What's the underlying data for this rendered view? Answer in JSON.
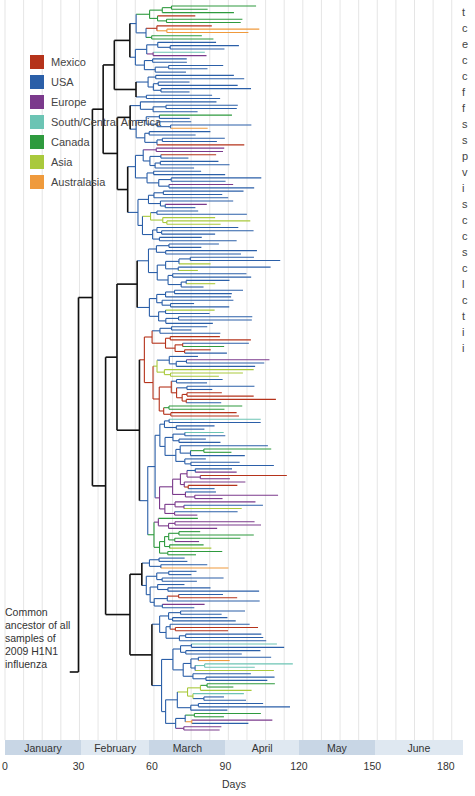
{
  "legend": [
    {
      "label": "Mexico",
      "key": "mexico",
      "color": "#b5331b"
    },
    {
      "label": "USA",
      "key": "usa",
      "color": "#2b5fa8"
    },
    {
      "label": "Europe",
      "key": "europe",
      "color": "#7b3a8c"
    },
    {
      "label": "South/Central America",
      "key": "sca",
      "color": "#6cc4b4"
    },
    {
      "label": "Canada",
      "key": "canada",
      "color": "#2e9a3e"
    },
    {
      "label": "Asia",
      "key": "asia",
      "color": "#a9c93c"
    },
    {
      "label": "Australasia",
      "key": "australasia",
      "color": "#ef9a3c"
    }
  ],
  "trunk_color": "#111111",
  "ancestor_note": [
    "Common",
    "ancestor of all",
    "samples of",
    "2009 H1N1",
    "influenza"
  ],
  "timeline": {
    "months": [
      "January",
      "February",
      "March",
      "April",
      "May",
      "June"
    ],
    "ticks": [
      "0",
      "30",
      "60",
      "90",
      "120",
      "150",
      "180"
    ],
    "tick_days": [
      0,
      30,
      60,
      90,
      120,
      150,
      180
    ],
    "axis_label": "Days",
    "range_days": [
      0,
      187
    ]
  },
  "side_text_fragments": [
    "t",
    "c",
    "e",
    "c",
    "c",
    "f",
    "f",
    "s",
    "s",
    "p",
    "v",
    "i",
    "s",
    "c",
    "c",
    "s",
    "c",
    "l",
    "c",
    "t",
    "i",
    "i"
  ],
  "tree": {
    "root_day": 15,
    "leaf_count": 220,
    "clades": [
      {
        "region": "usa",
        "share": 0.06
      },
      {
        "region": "mexico",
        "share": 0.05
      },
      {
        "region": "europe",
        "share": 0.12
      },
      {
        "region": "canada",
        "share": 0.05
      },
      {
        "region": "asia",
        "share": 0.07
      }
    ]
  }
}
